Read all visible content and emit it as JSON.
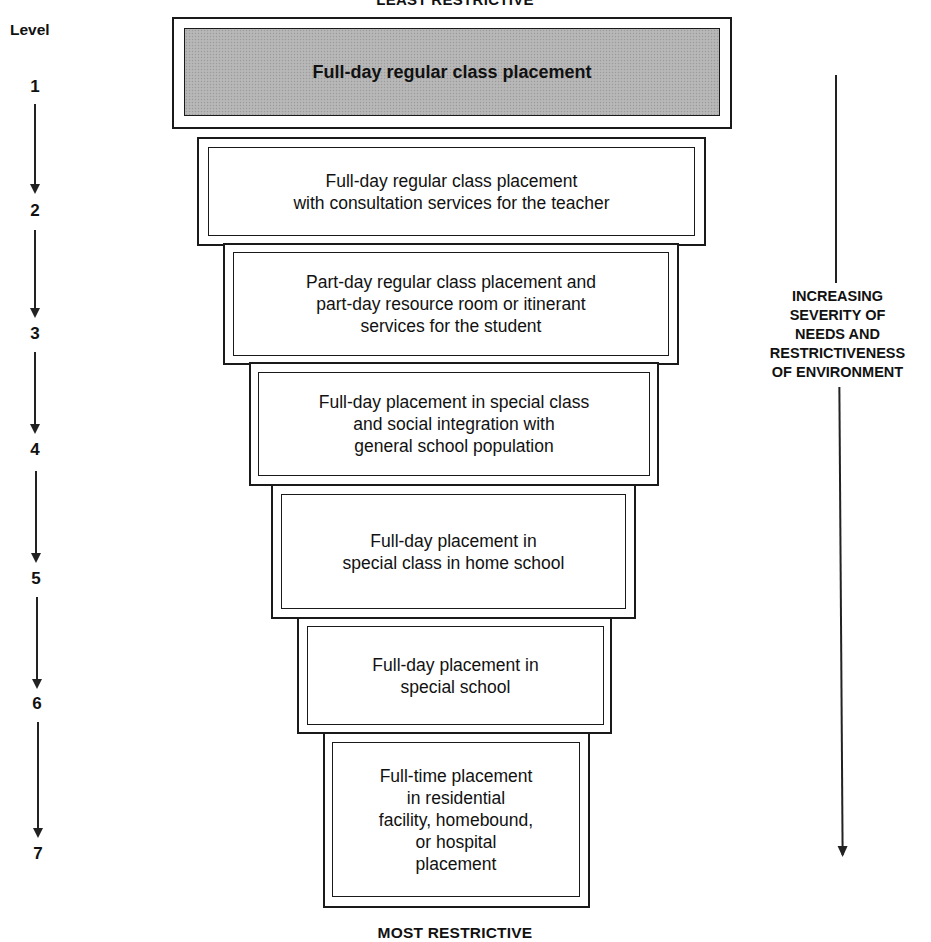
{
  "diagram": {
    "top_label": "LEAST RESTRICTIVE",
    "bottom_label": "MOST RESTRICTIVE",
    "level_header": "Level",
    "side_label": "INCREASING\nSEVERITY OF\nNEEDS AND\nRESTRICTIVENESS\nOF ENVIRONMENT",
    "shade_color": "#b3b3b3",
    "border_color": "#1a1a1a",
    "levels": [
      {
        "number": "1",
        "text": "Full-day regular class placement",
        "shaded": true
      },
      {
        "number": "2",
        "text": "Full-day regular class placement\nwith consultation services for the teacher",
        "shaded": false
      },
      {
        "number": "3",
        "text": "Part-day regular class placement and\npart-day resource room or itinerant\nservices for the student",
        "shaded": false
      },
      {
        "number": "4",
        "text": "Full-day placement in special class\nand social integration with\ngeneral school population",
        "shaded": false
      },
      {
        "number": "5",
        "text": "Full-day placement in\nspecial class in home school",
        "shaded": false
      },
      {
        "number": "6",
        "text": "Full-day placement in\nspecial school",
        "shaded": false
      },
      {
        "number": "7",
        "text": "Full-time placement\nin residential\nfacility, homebound,\nor hospital\nplacement",
        "shaded": false
      }
    ]
  }
}
